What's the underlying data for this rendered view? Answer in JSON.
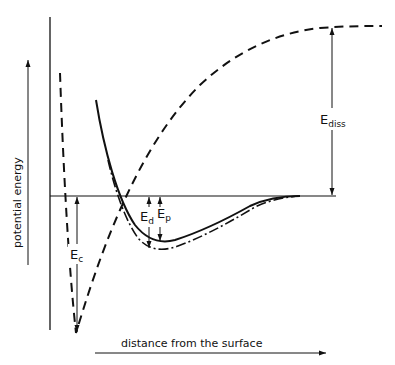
{
  "diagram": {
    "type": "potential energy diagram",
    "axes": {
      "y_label": "potential energy",
      "x_label": "distance from the surface"
    },
    "labels": {
      "e_diss": {
        "main": "E",
        "sub": "diss"
      },
      "e_c": {
        "main": "E",
        "sub": "c"
      },
      "e_d": {
        "main": "E",
        "sub": "d"
      },
      "e_p": {
        "main": "E",
        "sub": "p"
      }
    },
    "curves": [
      {
        "name": "atomic-chemisorption",
        "style": "dashed"
      },
      {
        "name": "molecular-physisorption",
        "style": "solid"
      },
      {
        "name": "molecular-physisorption-alt",
        "style": "dash-dot"
      }
    ],
    "colors": {
      "ink": "#111111",
      "background": "#ffffff"
    }
  }
}
